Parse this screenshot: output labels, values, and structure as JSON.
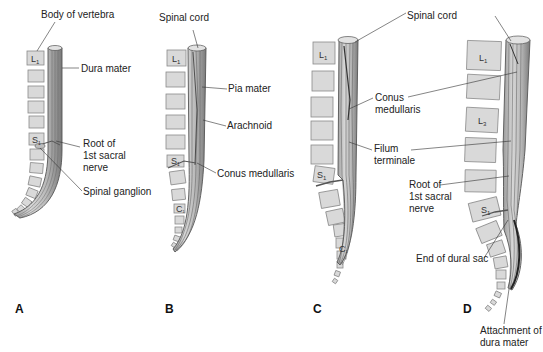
{
  "figure": {
    "panels": [
      {
        "id": "A",
        "letter": "A",
        "labels": {
          "body_of_vertebra": "Body of vertebra",
          "dura_mater": "Dura mater",
          "root_of_1st_sacral_nerve": "Root of\n1st sacral\nnerve",
          "spinal_ganglion": "Spinal ganglion"
        },
        "vertebra_labels": {
          "l1": "L",
          "l1_sub": "1",
          "s1": "S",
          "s1_sub": "1"
        }
      },
      {
        "id": "B",
        "letter": "B",
        "labels": {
          "spinal_cord": "Spinal cord",
          "pia_mater": "Pia mater",
          "arachnoid": "Arachnoid",
          "conus_medullaris": "Conus medullaris"
        },
        "vertebra_labels": {
          "l1": "L",
          "l1_sub": "1",
          "s1": "S",
          "s1_sub": "1",
          "c1": "C",
          "c1_sub": "1"
        }
      },
      {
        "id": "C",
        "letter": "C",
        "labels": {
          "conus_medullaris": "Conus\nmedullaris",
          "filum_terminale": "Filum\nterminale"
        },
        "vertebra_labels": {
          "l1": "L",
          "l1_sub": "1",
          "s1": "S",
          "s1_sub": "1",
          "c1": "C",
          "c1_sub": "1"
        }
      },
      {
        "id": "D",
        "letter": "D",
        "labels": {
          "spinal_cord": "Spinal cord",
          "root_of_1st_sacral_nerve": "Root of\n1st sacral\nnerve",
          "end_of_dural_sac": "End of dural sac",
          "attachment_of_dura_mater": "Attachment of\ndura mater"
        },
        "vertebra_labels": {
          "l1": "L",
          "l1_sub": "1",
          "l3": "L",
          "l3_sub": "3",
          "s1": "S",
          "s1_sub": "1"
        }
      }
    ],
    "colors": {
      "vertebra_fill": "#d9d9d9",
      "vertebra_stroke": "#8a8a8a",
      "cord_fill": "#c8c8c8",
      "cord_dark": "#555555",
      "leader_line": "#333333",
      "text": "#222222"
    }
  }
}
